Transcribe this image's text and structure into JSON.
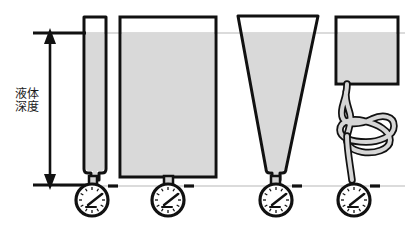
{
  "figure": {
    "title": "",
    "annotations": {
      "depth_label_line1": "液体",
      "depth_label_line2": "深度"
    },
    "colors": {
      "liquid_fill": "#d9d9d9",
      "outline": "#111111",
      "level_line": "#cccccc",
      "hose_fill": "#d0d0d0",
      "background": "#ffffff",
      "gauge_face": "#ffffff"
    },
    "reference_lines": {
      "top_liquid_level_y": 33,
      "bottom_gauge_level_y": 185
    },
    "dimension_arrow": {
      "name": "liquid-depth-arrow",
      "x": 50,
      "top_y": 33,
      "bottom_y": 185
    },
    "vessels": [
      {
        "id": "vessel-1",
        "shape": "narrow-tube",
        "label": "",
        "liquid_level_y": 33,
        "rim_y": 17,
        "bottom_y": 172,
        "left_x": 84,
        "right_x": 106
      },
      {
        "id": "vessel-2",
        "shape": "wide-rectangle",
        "label": "",
        "liquid_level_y": 33,
        "rim_y": 17,
        "bottom_y": 177,
        "left_x": 120,
        "right_x": 216
      },
      {
        "id": "vessel-3",
        "shape": "inverted-cone",
        "label": "",
        "liquid_level_y": 33,
        "rim_y": 16,
        "bottom_y": 172,
        "top_left_x": 238,
        "top_right_x": 318,
        "bottom_left_x": 268,
        "bottom_right_x": 284
      },
      {
        "id": "vessel-4",
        "shape": "small-box-with-coiled-hose",
        "label": "",
        "liquid_level_y": 33,
        "rim_y": 17,
        "bottom_y": 84,
        "left_x": 336,
        "right_x": 398
      }
    ],
    "gauges": [
      {
        "id": "gauge-1",
        "cx": 92,
        "cy": 200,
        "r": 16,
        "needle_angle_deg": -35
      },
      {
        "id": "gauge-2",
        "cx": 168,
        "cy": 200,
        "r": 16,
        "needle_angle_deg": -35
      },
      {
        "id": "gauge-3",
        "cx": 276,
        "cy": 200,
        "r": 16,
        "needle_angle_deg": -35
      },
      {
        "id": "gauge-4",
        "cx": 354,
        "cy": 200,
        "r": 16,
        "needle_angle_deg": -35
      }
    ],
    "tick_dashes": [
      {
        "id": "dash-1",
        "x": 112,
        "y": 186
      },
      {
        "id": "dash-2",
        "x": 188,
        "y": 186
      },
      {
        "id": "dash-3",
        "x": 296,
        "y": 186
      },
      {
        "id": "dash-4",
        "x": 374,
        "y": 186
      }
    ]
  }
}
